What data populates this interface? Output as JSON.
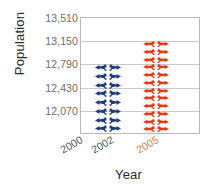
{
  "chart_data": {
    "type": "bar",
    "title": "",
    "subtitle": "",
    "xlabel": "Year",
    "ylabel": "Population",
    "categories": [
      "2000",
      "2002",
      "2005"
    ],
    "series": [
      {
        "name": "2002",
        "category": "2002",
        "value": 12790,
        "color": "#1F3A7A",
        "icon_count": 8,
        "icon": "person-icon"
      },
      {
        "name": "2005",
        "category": "2005",
        "value": 13150,
        "color": "#E8380D",
        "icon_count": 12,
        "icon": "person-icon"
      }
    ],
    "values": [
      null,
      12790,
      13150
    ],
    "ylim": [
      11890,
      13510
    ],
    "ytick_labels": [
      "13,510",
      "13,150",
      "12,790",
      "12,430",
      "12,070"
    ],
    "ytick_values": [
      13510,
      13150,
      12790,
      12430,
      12070
    ],
    "ytick_step": 360,
    "grid": true,
    "legend": "none",
    "marker_style": "pictograph-person-stack",
    "xtick_rotation_deg": -30
  },
  "axes": {
    "y_title": "Population",
    "x_title": "Year",
    "y_ticks": [
      {
        "label": "13,510",
        "value": 13510
      },
      {
        "label": "13,150",
        "value": 13150
      },
      {
        "label": "12,790",
        "value": 12790
      },
      {
        "label": "12,430",
        "value": 12430
      },
      {
        "label": "12,070",
        "value": 12070
      }
    ],
    "x_ticks": [
      {
        "label": "2000",
        "color": "#555555"
      },
      {
        "label": "2002",
        "color": "#555555"
      },
      {
        "label": "2005",
        "color": "#E08050"
      }
    ]
  },
  "colors": {
    "series_blue": "#1F3A7A",
    "series_red": "#E8380D",
    "gridline": "#c9c9c9",
    "plot_border": "#b9b9b9",
    "tick_text": "#6e6e6e",
    "title_text": "#2b2b2b",
    "highlight_label": "#E08050"
  }
}
